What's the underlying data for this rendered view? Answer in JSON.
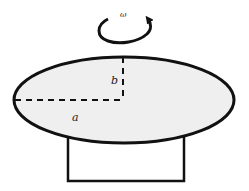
{
  "diagram": {
    "labels": {
      "omega": "ω",
      "semi_major": "a",
      "semi_minor": "b"
    },
    "colors": {
      "stroke": "#111111",
      "ellipse_fill": "#efefef",
      "background": "#ffffff"
    },
    "rotation_direction": "counterclockwise"
  }
}
